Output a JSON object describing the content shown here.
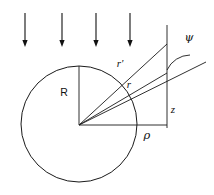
{
  "figure": {
    "background_color": "#ffffff",
    "ink_color": "#111111",
    "width": 214,
    "height": 195,
    "labels": {
      "radius": "R",
      "source_distance": "r'",
      "field_distance": "r",
      "axial_coordinate": "z",
      "radial_coordinate": "ρ",
      "scattering_angle": "ψ"
    },
    "label_positions": {
      "radius": {
        "x": 64,
        "y": 96
      },
      "source_distance": {
        "x": 120,
        "y": 67
      },
      "field_distance": {
        "x": 129,
        "y": 88
      },
      "axial_coordinate": {
        "x": 173,
        "y": 113
      },
      "radial_coordinate": {
        "x": 147,
        "y": 139
      },
      "scattering_angle": {
        "x": 189,
        "y": 41
      }
    },
    "sphere": {
      "center_x": 79,
      "center_y": 124,
      "radius": 58
    },
    "incident_arrows": {
      "count": 4,
      "direction": "down",
      "x_positions": [
        25,
        62,
        96,
        130
      ],
      "y_start": 13,
      "y_end": 47,
      "head_length": 7,
      "head_half_width": 2.6
    },
    "vertical_axis": {
      "x": 167,
      "y_top": 25,
      "y_bottom": 128
    },
    "baseline": {
      "x_start": 79,
      "x_end": 167,
      "y": 125
    },
    "radius_line": {
      "x_start": 79,
      "y_start": 125,
      "x_end": 79,
      "y_end": 66
    },
    "r_prime_line": {
      "x_start": 79,
      "y_start": 125,
      "x_end": 167,
      "y_end": 44
    },
    "r_line": {
      "x_start": 79,
      "y_start": 125,
      "x_end": 167,
      "y_end": 73
    },
    "scattered_ray": {
      "x_start": 79,
      "y_start": 125,
      "x_end": 206,
      "y_end": 62
    },
    "angle_arc": {
      "center_x": 167,
      "center_y": 44,
      "radius": 26,
      "start_x": 167,
      "start_y": 70,
      "end_x": 190,
      "end_y": 55
    }
  }
}
